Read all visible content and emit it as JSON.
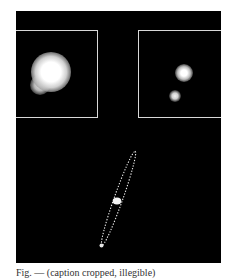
{
  "figure": {
    "background": "#000000",
    "frame_color": "#d8d8d8",
    "insets": [
      {
        "name": "left",
        "description": "blended binary, low resolution"
      },
      {
        "name": "right",
        "description": "resolved binary, two point sources"
      }
    ],
    "lower_panel": {
      "overlay": "dotted ellipse enclosing primary and companion",
      "sources": [
        "primary",
        "companion"
      ]
    }
  },
  "caption": {
    "text": "Fig. — (caption cropped, illegible)"
  }
}
